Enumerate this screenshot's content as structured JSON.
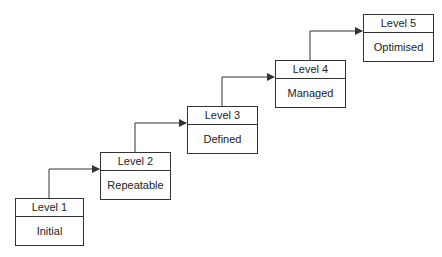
{
  "diagram": {
    "type": "staircase-maturity-model",
    "levels": [
      {
        "level": "Level 1",
        "name": "Initial"
      },
      {
        "level": "Level 2",
        "name": "Repeatable"
      },
      {
        "level": "Level 3",
        "name": "Defined"
      },
      {
        "level": "Level 4",
        "name": "Managed"
      },
      {
        "level": "Level 5",
        "name": "Optimised"
      }
    ],
    "colors": {
      "line": "#333333",
      "background": "#ffffff",
      "text": "#222222"
    }
  }
}
